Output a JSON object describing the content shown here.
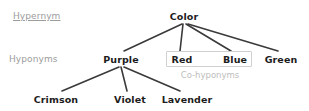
{
  "figure": {
    "type": "hierarchy-tree",
    "background_color": "#ffffff",
    "node_text_color": "#1c1c1c",
    "edge_color": "#3a3a3a",
    "label_color": "#9c9c9c",
    "caption_color": "#bdbdbd",
    "box_border_color": "#d0d0d0"
  },
  "row_labels": [
    {
      "text": "Hypernym",
      "x": 13,
      "y": 11,
      "underlined": true
    },
    {
      "text": "Hyponyms",
      "x": 9,
      "y": 54,
      "underlined": false
    }
  ],
  "nodes": [
    {
      "id": "color",
      "text": "Color",
      "x": 184,
      "y": 11
    },
    {
      "id": "purple",
      "text": "Purple",
      "x": 121,
      "y": 54
    },
    {
      "id": "red",
      "text": "Red",
      "x": 182,
      "y": 54
    },
    {
      "id": "blue",
      "text": "Blue",
      "x": 235,
      "y": 54
    },
    {
      "id": "green",
      "text": "Green",
      "x": 281,
      "y": 54
    },
    {
      "id": "crimson",
      "text": "Crimson",
      "x": 56,
      "y": 94
    },
    {
      "id": "violet",
      "text": "Violet",
      "x": 130,
      "y": 94
    },
    {
      "id": "lavender",
      "text": "Lavender",
      "x": 187,
      "y": 94
    }
  ],
  "edges": [
    {
      "from": "color",
      "to": "purple",
      "x1": 182,
      "y1": 24,
      "x2": 124,
      "y2": 51
    },
    {
      "from": "color",
      "to": "red",
      "x1": 183,
      "y1": 24,
      "x2": 180,
      "y2": 51
    },
    {
      "from": "color",
      "to": "blue",
      "x1": 186,
      "y1": 24,
      "x2": 231,
      "y2": 51
    },
    {
      "from": "color",
      "to": "green",
      "x1": 188,
      "y1": 24,
      "x2": 278,
      "y2": 51
    },
    {
      "from": "purple",
      "to": "crimson",
      "x1": 119,
      "y1": 67,
      "x2": 62,
      "y2": 91
    },
    {
      "from": "purple",
      "to": "violet",
      "x1": 121,
      "y1": 67,
      "x2": 127,
      "y2": 91
    },
    {
      "from": "purple",
      "to": "lavender",
      "x1": 124,
      "y1": 67,
      "x2": 180,
      "y2": 91
    }
  ],
  "group_box": {
    "label": "Co-hyponyms",
    "x": 166,
    "y": 51,
    "width": 86,
    "height": 16,
    "caption_x": 210,
    "caption_y": 70,
    "members": [
      "Red",
      "Blue"
    ]
  }
}
